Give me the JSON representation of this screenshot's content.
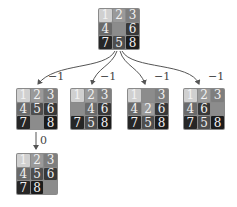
{
  "tile_colors": {
    "1": "#d0d0d0",
    "2": "#9a9a9a",
    "3": "#7e7e7e",
    "4": "#6a6a6a",
    "5": "#4e4e4e",
    "6": "#383838",
    "7": "#262626",
    "8": "#1c1c1c",
    "blank": "#8c8c8c"
  },
  "nodes": [
    {
      "id": "root",
      "x": 98,
      "y": 8,
      "tiles": [
        "1",
        "2",
        "3",
        "4",
        "",
        "6",
        "7",
        "5",
        "8"
      ]
    },
    {
      "id": "child-1",
      "x": 16,
      "y": 88,
      "tiles": [
        "1",
        "2",
        "3",
        "4",
        "5",
        "6",
        "7",
        "",
        "8"
      ]
    },
    {
      "id": "child-2",
      "x": 70,
      "y": 88,
      "tiles": [
        "1",
        "2",
        "3",
        "",
        "4",
        "6",
        "7",
        "5",
        "8"
      ]
    },
    {
      "id": "child-3",
      "x": 127,
      "y": 88,
      "tiles": [
        "1",
        "",
        "3",
        "4",
        "2",
        "6",
        "7",
        "5",
        "8"
      ]
    },
    {
      "id": "child-4",
      "x": 183,
      "y": 88,
      "tiles": [
        "1",
        "2",
        "3",
        "4",
        "6",
        "",
        "7",
        "5",
        "8"
      ]
    },
    {
      "id": "grandchild-1",
      "x": 16,
      "y": 153,
      "tiles": [
        "1",
        "2",
        "3",
        "4",
        "5",
        "6",
        "7",
        "8",
        ""
      ]
    }
  ],
  "edges": [
    {
      "from": "root",
      "to": "child-1",
      "label": "−1"
    },
    {
      "from": "root",
      "to": "child-2",
      "label": "−1"
    },
    {
      "from": "root",
      "to": "child-3",
      "label": "−1"
    },
    {
      "from": "root",
      "to": "child-4",
      "label": "−1"
    },
    {
      "from": "child-1",
      "to": "grandchild-1",
      "label": "0"
    }
  ]
}
